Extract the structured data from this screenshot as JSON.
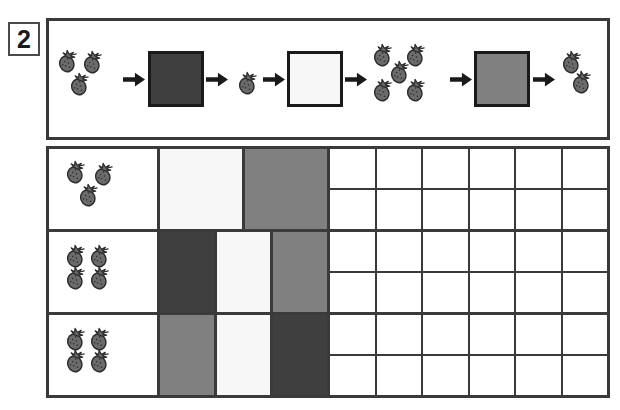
{
  "exercise": {
    "number": "2"
  },
  "palette": {
    "dark": "#3f3f3f",
    "gray": "#808080",
    "white": "#f7f7f7",
    "border": "#3a3a3a",
    "berry_body": "#6b6b6b",
    "berry_outline": "#2b2b2b",
    "page_background": "#ffffff"
  },
  "sequence_panel": {
    "name": "pattern-sequence",
    "steps": [
      {
        "kind": "berries",
        "count": 3,
        "label": "three-strawberries"
      },
      {
        "kind": "arrow",
        "label": "arrow-right"
      },
      {
        "kind": "square",
        "color": "dark",
        "label": "dark-square"
      },
      {
        "kind": "arrow",
        "label": "arrow-right"
      },
      {
        "kind": "berries",
        "count": 1,
        "label": "one-strawberry"
      },
      {
        "kind": "arrow",
        "label": "arrow-right"
      },
      {
        "kind": "square",
        "color": "white",
        "label": "white-square"
      },
      {
        "kind": "arrow",
        "label": "arrow-right"
      },
      {
        "kind": "berries",
        "count": 5,
        "label": "five-strawberries"
      },
      {
        "kind": "arrow",
        "label": "arrow-right"
      },
      {
        "kind": "square",
        "color": "gray",
        "label": "gray-square"
      },
      {
        "kind": "arrow",
        "label": "arrow-right"
      },
      {
        "kind": "berries",
        "count": 2,
        "label": "two-strawberries"
      }
    ]
  },
  "answer_grid": {
    "name": "answer-grid",
    "empty_columns": 6,
    "empty_subrows": 2,
    "rows": [
      {
        "label": "row-1",
        "berry_count": 3,
        "pattern": [
          "white",
          "gray"
        ]
      },
      {
        "label": "row-2",
        "berry_count": 4,
        "pattern": [
          "dark",
          "white",
          "gray"
        ]
      },
      {
        "label": "row-3",
        "berry_count": 4,
        "pattern": [
          "gray",
          "white",
          "dark"
        ]
      }
    ]
  }
}
